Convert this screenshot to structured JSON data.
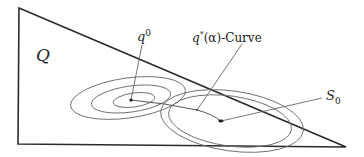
{
  "labels": {
    "region": "Q",
    "q0_base": "q",
    "q0_sup": "0",
    "curve_q": "q",
    "curve_sup": "*",
    "curve_rest": "(α)-Curve",
    "s0_base": "S",
    "s0_sub": "0"
  },
  "colors": {
    "stroke": "#2a2a2a",
    "contour": "#6a6a6a",
    "background": "#ffffff"
  }
}
